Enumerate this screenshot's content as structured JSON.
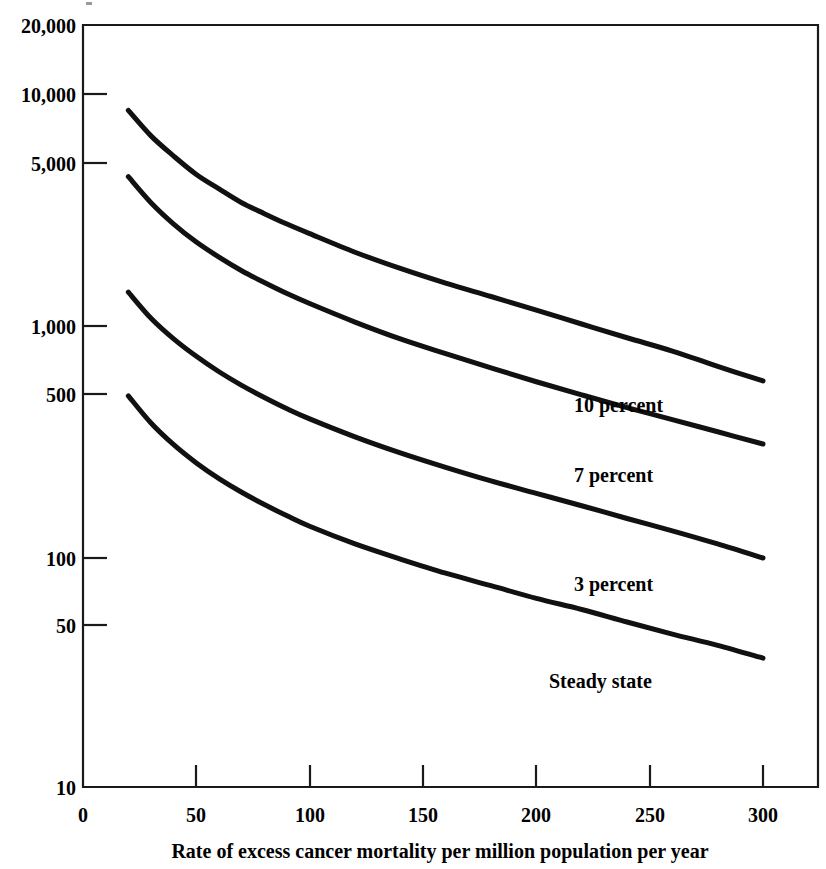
{
  "figure": {
    "background_color": "#ffffff",
    "ink_color": "#111111"
  },
  "chart_data": {
    "type": "line",
    "title": "",
    "subtitle": "",
    "xlabel": "Rate of excess cancer mortality per million population per year",
    "ylabel": "",
    "xlim": [
      0,
      310
    ],
    "ylim": [
      10,
      20000
    ],
    "yscale": "log",
    "xscale": "linear",
    "grid": false,
    "legend_position": "inline-right-of-curve-ends",
    "xticks": [
      0,
      50,
      100,
      150,
      200,
      250,
      300
    ],
    "xticklabels": [
      "0",
      "50",
      "100",
      "150",
      "200",
      "250",
      "300"
    ],
    "yticks": [
      10,
      50,
      100,
      500,
      1000,
      5000,
      10000,
      20000
    ],
    "yticklabels": [
      "10",
      "50",
      "100",
      "500",
      "1,000",
      "5,000",
      "10,000",
      "20,000"
    ],
    "x": [
      20,
      30,
      40,
      50,
      60,
      70,
      80,
      90,
      100,
      120,
      140,
      160,
      180,
      200,
      220,
      240,
      260,
      280,
      300
    ],
    "series": [
      {
        "name": "10 percent",
        "label": "10 percent",
        "values": [
          8500,
          6600,
          5400,
          4500,
          3900,
          3400,
          3050,
          2750,
          2500,
          2080,
          1770,
          1530,
          1340,
          1170,
          1020,
          890,
          780,
          670,
          580
        ]
      },
      {
        "name": "7 percent",
        "label": "7 percent",
        "values": [
          4400,
          3400,
          2750,
          2300,
          1980,
          1730,
          1540,
          1380,
          1250,
          1040,
          880,
          760,
          660,
          575,
          505,
          445,
          395,
          350,
          310
        ]
      },
      {
        "name": "3 percent",
        "label": "3 percent",
        "values": [
          1400,
          1080,
          880,
          740,
          635,
          555,
          492,
          440,
          398,
          333,
          284,
          246,
          215,
          190,
          168,
          148,
          131,
          115,
          100
        ]
      },
      {
        "name": "Steady state",
        "label": "Steady state",
        "values": [
          500,
          382,
          308,
          257,
          220,
          192,
          170,
          152,
          137,
          115,
          99,
          86,
          76,
          67,
          60,
          53,
          47,
          42,
          37
        ]
      }
    ],
    "annotations": [
      {
        "text": "10 percent",
        "x": 215,
        "y": 420
      },
      {
        "text": "7 percent",
        "x": 215,
        "y": 225
      },
      {
        "text": "3 percent",
        "x": 215,
        "y": 72
      },
      {
        "text": "Steady state",
        "x": 200,
        "y": 27
      }
    ]
  }
}
